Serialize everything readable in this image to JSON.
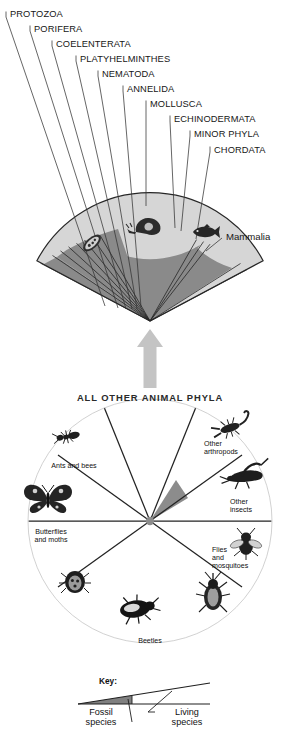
{
  "figure": {
    "title_overlay": "ALL OTHER ANIMAL PHYLA",
    "colors": {
      "living": "#d6d6d6",
      "fossil": "#8a8a8a",
      "wheel": "#c9c9c9",
      "arrow": "#c4c4c4",
      "outline": "#2a2a2a",
      "background": "#ffffff",
      "text": "#161616"
    }
  },
  "top_fan": {
    "name": "animal-phyla-fan",
    "labels": [
      {
        "id": "protozoa",
        "text": "PROTOZOA"
      },
      {
        "id": "porifera",
        "text": "PORIFERA"
      },
      {
        "id": "coelenterata",
        "text": "COELENTERATA"
      },
      {
        "id": "platyhelminthes",
        "text": "PLATYHELMINTHES"
      },
      {
        "id": "nematoda",
        "text": "NEMATODA"
      },
      {
        "id": "annelida",
        "text": "ANNELIDA"
      },
      {
        "id": "mollusca",
        "text": "MOLLUSCA"
      },
      {
        "id": "echinodermata",
        "text": "ECHINODERMATA"
      },
      {
        "id": "minor-phyla",
        "text": "MINOR PHYLA"
      },
      {
        "id": "chordata",
        "text": "CHORDATA"
      },
      {
        "id": "mammalia",
        "text": "Mammalia"
      }
    ],
    "icons": [
      {
        "id": "protozoan-icon",
        "label": "protozoan"
      },
      {
        "id": "snail-icon",
        "label": "mollusc-snail"
      },
      {
        "id": "fish-icon",
        "label": "fish"
      }
    ]
  },
  "arrow": {
    "name": "upward-arrow",
    "direction": "up"
  },
  "wheel": {
    "name": "arthropoda-wheel",
    "center_labels": [
      "Insects",
      "ARTHROPODA"
    ],
    "segments": [
      {
        "id": "ants-and-bees",
        "text": "Ants and bees",
        "icon": "ant-icon"
      },
      {
        "id": "butterflies-moths",
        "text": "Butterflies\nand moths",
        "icon": "butterfly-icon"
      },
      {
        "id": "true-bugs",
        "text": "",
        "icon": "bug-icon"
      },
      {
        "id": "beetles",
        "text": "Beetles",
        "icon": "beetle-icon"
      },
      {
        "id": "weevil",
        "text": "",
        "icon": "weevil-icon"
      },
      {
        "id": "flies-mosquitoes",
        "text": "Flies\nand\nmosquitoes",
        "icon": "fly-icon"
      },
      {
        "id": "other-insects",
        "text": "Other\ninsects",
        "icon": "grasshopper-icon"
      },
      {
        "id": "other-arthropods",
        "text": "Other\narthropods",
        "icon": "scorpion-icon"
      }
    ],
    "labels": {
      "ants_and_bees": "Ants and bees",
      "butterflies_l1": "Butterflies",
      "butterflies_l2": "and moths",
      "beetles": "Beetles",
      "flies_l1": "Flies",
      "flies_l2": "and",
      "flies_l3": "mosquitoes",
      "other_insects_l1": "Other",
      "other_insects_l2": "insects",
      "other_arthropods_l1": "Other",
      "other_arthropods_l2": "arthropods",
      "insects": "Insects",
      "arthropoda": "ARTHROPODA"
    }
  },
  "key": {
    "name": "legend",
    "title": "Key:",
    "fossil_l1": "Fossil",
    "fossil_l2": "species",
    "living_l1": "Living",
    "living_l2": "species"
  }
}
